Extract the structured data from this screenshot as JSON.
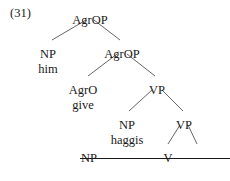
{
  "example": {
    "number_label": "(31)"
  },
  "tree": {
    "nodes": [
      {
        "id": "root",
        "label": "AgrOP",
        "x": 90,
        "y": 14,
        "struck": false
      },
      {
        "id": "np-subj",
        "label": "NP",
        "x": 48,
        "y": 48,
        "struck": false
      },
      {
        "id": "agrop-bar",
        "label": "AgrOP",
        "x": 122,
        "y": 48,
        "struck": false
      },
      {
        "id": "agro-head",
        "label": "AgrO",
        "x": 83,
        "y": 84,
        "struck": false
      },
      {
        "id": "vp-upper",
        "label": "VP",
        "x": 157,
        "y": 84,
        "struck": false
      },
      {
        "id": "np-obj",
        "label": "NP",
        "x": 127,
        "y": 119,
        "struck": false
      },
      {
        "id": "vp-lower",
        "label": "VP",
        "x": 184,
        "y": 119,
        "struck": false
      },
      {
        "id": "v-head",
        "label": "V",
        "x": 168,
        "y": 152,
        "struck": false
      },
      {
        "id": "np-trace",
        "label": "NP",
        "x": 196,
        "y": 152,
        "struck": true
      }
    ],
    "terminals": [
      {
        "id": "word-him-top",
        "word": "him",
        "x": 48,
        "y": 63,
        "struck": false
      },
      {
        "id": "word-give-agro",
        "word": "give",
        "x": 83,
        "y": 99,
        "struck": false
      },
      {
        "id": "word-haggis",
        "word": "haggis",
        "x": 127,
        "y": 134,
        "struck": false
      },
      {
        "id": "word-give-trace",
        "word": "give",
        "x": 168,
        "y": 167,
        "struck": true
      },
      {
        "id": "word-him-trace",
        "word": "him",
        "x": 196,
        "y": 167,
        "struck": true
      }
    ],
    "branches": [
      {
        "id": "root-to-np-subj",
        "x1": 86,
        "y1": 20,
        "x2": 52,
        "y2": 40
      },
      {
        "id": "root-to-agrop-bar",
        "x1": 94,
        "y1": 20,
        "x2": 120,
        "y2": 40
      },
      {
        "id": "agrop-to-agro",
        "x1": 117,
        "y1": 54,
        "x2": 88,
        "y2": 76
      },
      {
        "id": "agrop-to-vp-upper",
        "x1": 127,
        "y1": 54,
        "x2": 155,
        "y2": 76
      },
      {
        "id": "vp-upper-to-np-obj",
        "x1": 152,
        "y1": 90,
        "x2": 129,
        "y2": 111
      },
      {
        "id": "vp-upper-to-vp-lower",
        "x1": 162,
        "y1": 90,
        "x2": 183,
        "y2": 111
      },
      {
        "id": "vp-lower-to-v",
        "x1": 180,
        "y1": 125,
        "x2": 168,
        "y2": 144
      },
      {
        "id": "vp-lower-to-np-trace",
        "x1": 188,
        "y1": 125,
        "x2": 197,
        "y2": 144
      }
    ],
    "line_color": "#555555"
  }
}
